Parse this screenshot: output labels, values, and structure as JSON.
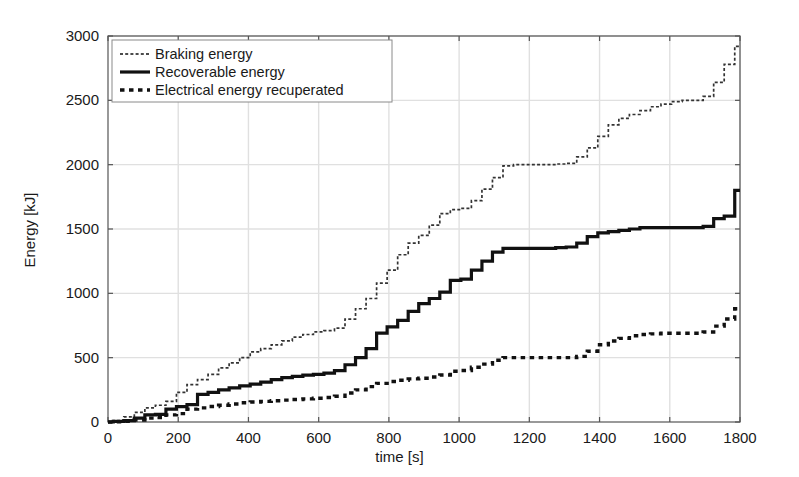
{
  "chart_data": {
    "type": "line",
    "title": "",
    "xlabel": "time [s]",
    "ylabel": "Energy [kJ]",
    "xlim": [
      0,
      1800
    ],
    "ylim": [
      0,
      3000
    ],
    "xticks": [
      0,
      200,
      400,
      600,
      800,
      1000,
      1200,
      1400,
      1600,
      1800
    ],
    "yticks": [
      0,
      500,
      1000,
      1500,
      2000,
      2500,
      3000
    ],
    "grid": true,
    "legend_position": "top-left",
    "series": [
      {
        "name": "Braking energy",
        "style": "fine-dotted",
        "color": "#333333",
        "x": [
          0,
          30,
          60,
          90,
          120,
          150,
          180,
          210,
          240,
          270,
          300,
          330,
          360,
          390,
          420,
          450,
          480,
          510,
          540,
          570,
          600,
          630,
          660,
          690,
          720,
          750,
          780,
          810,
          840,
          870,
          900,
          930,
          960,
          990,
          1020,
          1050,
          1080,
          1110,
          1140,
          1170,
          1200,
          1230,
          1260,
          1290,
          1320,
          1350,
          1380,
          1410,
          1440,
          1470,
          1500,
          1530,
          1560,
          1590,
          1620,
          1650,
          1680,
          1710,
          1740,
          1770,
          1800
        ],
        "y": [
          0,
          10,
          40,
          75,
          110,
          130,
          160,
          230,
          290,
          330,
          370,
          420,
          460,
          500,
          545,
          570,
          600,
          630,
          660,
          680,
          700,
          710,
          730,
          800,
          880,
          960,
          1080,
          1180,
          1300,
          1390,
          1450,
          1530,
          1620,
          1650,
          1660,
          1720,
          1810,
          1900,
          1990,
          2000,
          2000,
          2000,
          2000,
          2005,
          2010,
          2060,
          2130,
          2220,
          2310,
          2360,
          2390,
          2420,
          2450,
          2470,
          2490,
          2500,
          2500,
          2530,
          2640,
          2780,
          2920
        ]
      },
      {
        "name": "Recoverable energy",
        "style": "solid",
        "color": "#111111",
        "x": [
          0,
          30,
          60,
          90,
          120,
          150,
          180,
          210,
          240,
          270,
          300,
          330,
          360,
          390,
          420,
          450,
          480,
          510,
          540,
          570,
          600,
          630,
          660,
          690,
          720,
          750,
          780,
          810,
          840,
          870,
          900,
          930,
          960,
          990,
          1020,
          1050,
          1080,
          1110,
          1140,
          1170,
          1200,
          1230,
          1260,
          1290,
          1320,
          1350,
          1380,
          1410,
          1440,
          1470,
          1500,
          1530,
          1560,
          1590,
          1620,
          1650,
          1680,
          1710,
          1740,
          1770,
          1800
        ],
        "y": [
          0,
          5,
          10,
          30,
          55,
          60,
          100,
          120,
          135,
          215,
          230,
          250,
          265,
          280,
          295,
          310,
          330,
          345,
          355,
          365,
          370,
          380,
          400,
          445,
          500,
          570,
          690,
          740,
          790,
          860,
          920,
          960,
          1010,
          1100,
          1110,
          1180,
          1250,
          1320,
          1350,
          1350,
          1350,
          1350,
          1350,
          1355,
          1360,
          1390,
          1440,
          1470,
          1480,
          1490,
          1500,
          1510,
          1510,
          1510,
          1510,
          1510,
          1510,
          1520,
          1580,
          1600,
          1800
        ]
      },
      {
        "name": "Electrical energy recuperated",
        "style": "dotted",
        "color": "#111111",
        "x": [
          0,
          30,
          60,
          90,
          120,
          150,
          180,
          210,
          240,
          270,
          300,
          330,
          360,
          390,
          420,
          450,
          480,
          510,
          540,
          570,
          600,
          630,
          660,
          690,
          720,
          750,
          780,
          810,
          840,
          870,
          900,
          930,
          960,
          990,
          1020,
          1050,
          1080,
          1110,
          1140,
          1170,
          1200,
          1230,
          1260,
          1290,
          1320,
          1350,
          1380,
          1410,
          1440,
          1470,
          1500,
          1530,
          1560,
          1590,
          1620,
          1650,
          1680,
          1710,
          1740,
          1770,
          1800
        ],
        "y": [
          0,
          2,
          5,
          15,
          30,
          35,
          55,
          65,
          100,
          110,
          120,
          130,
          140,
          150,
          155,
          160,
          165,
          170,
          175,
          180,
          185,
          190,
          200,
          225,
          250,
          275,
          300,
          315,
          325,
          335,
          340,
          350,
          365,
          395,
          400,
          425,
          450,
          480,
          500,
          500,
          500,
          500,
          500,
          500,
          500,
          510,
          550,
          600,
          630,
          650,
          670,
          680,
          685,
          690,
          690,
          690,
          690,
          700,
          745,
          800,
          880
        ]
      }
    ]
  },
  "legend": {
    "entries": [
      {
        "label": "Braking energy",
        "marker": "fine-dotted"
      },
      {
        "label": "Recoverable energy",
        "marker": "solid"
      },
      {
        "label": "Electrical energy recuperated",
        "marker": "dotted"
      }
    ]
  },
  "axes": {
    "x_label": "time [s]",
    "y_label": "Energy [kJ]"
  },
  "colors": {
    "background": "#ffffff",
    "axis": "#555555",
    "grid": "#e0e0e0",
    "series_primary": "#111111"
  }
}
